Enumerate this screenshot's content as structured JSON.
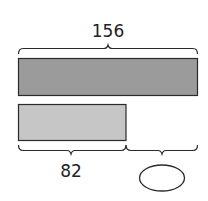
{
  "diagram": {
    "type": "bar-model",
    "total_label": "156",
    "part_label": "82",
    "unknown_label": "",
    "colors": {
      "top_bar": "#9b9b9b",
      "bottom_bar": "#c6c6c6",
      "stroke": "#2a2a2a",
      "background": "#ffffff"
    },
    "bars": [
      {
        "name": "total",
        "value": 156
      },
      {
        "name": "known-part",
        "value": 82
      }
    ]
  }
}
